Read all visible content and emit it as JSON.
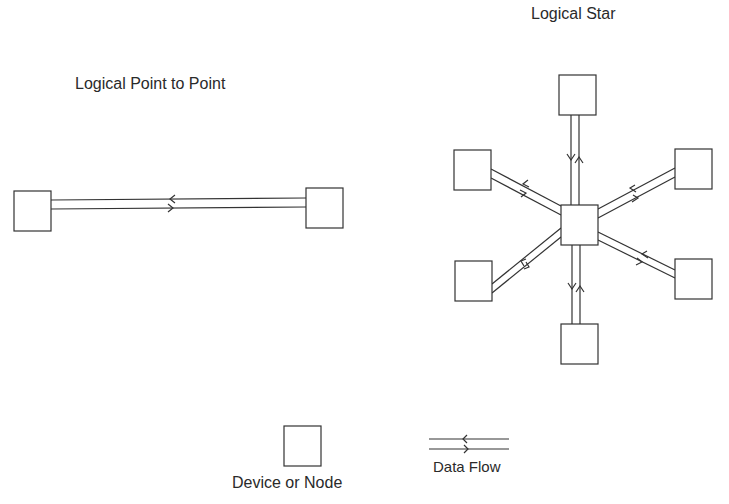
{
  "titles": {
    "point_to_point": "Logical Point to Point",
    "star": "Logical Star"
  },
  "legend": {
    "node_label": "Device or Node",
    "flow_label": "Data Flow"
  },
  "colors": {
    "stroke": "#333333",
    "background": "#ffffff"
  },
  "point_to_point": {
    "nodes": [
      {
        "name": "left-node",
        "x": 14,
        "y": 191,
        "w": 37,
        "h": 40
      },
      {
        "name": "right-node",
        "x": 306,
        "y": 188,
        "w": 37,
        "h": 40
      }
    ]
  },
  "star": {
    "hub": {
      "x": 561,
      "y": 205,
      "w": 37,
      "h": 40
    },
    "nodes": [
      {
        "name": "top",
        "x": 559,
        "y": 75,
        "w": 37,
        "h": 40
      },
      {
        "name": "upper-left",
        "x": 454,
        "y": 150,
        "w": 37,
        "h": 40
      },
      {
        "name": "upper-right",
        "x": 675,
        "y": 149,
        "w": 37,
        "h": 40
      },
      {
        "name": "lower-left",
        "x": 455,
        "y": 261,
        "w": 37,
        "h": 40
      },
      {
        "name": "lower-right",
        "x": 675,
        "y": 259,
        "w": 37,
        "h": 40
      },
      {
        "name": "bottom",
        "x": 561,
        "y": 324,
        "w": 37,
        "h": 40
      }
    ]
  }
}
